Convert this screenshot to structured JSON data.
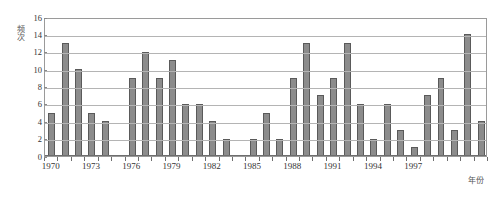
{
  "chart_data": {
    "type": "bar",
    "title": "",
    "xlabel": "年份",
    "ylabel": "频次",
    "ylim": [
      0,
      16
    ],
    "ytick_step": 2,
    "yticks": [
      0,
      2,
      4,
      6,
      8,
      10,
      12,
      14,
      16
    ],
    "xlim": [
      1970,
      2000
    ],
    "xticks": [
      1970,
      1973,
      1976,
      1979,
      1982,
      1985,
      1988,
      1991,
      1994,
      1997
    ],
    "xtick_labels": [
      "1970",
      "1973",
      "1976",
      "1979",
      "1982",
      "1985",
      "1988",
      "1991",
      "1994",
      "1997"
    ],
    "grid": true,
    "grid_axis": "y",
    "legend": false,
    "bar_color": "#8c8c8c",
    "bar_edge_color": "#5a5a5a",
    "categories": [
      "1970",
      "1971",
      "1972",
      "1973",
      "1974",
      "1975",
      "1976",
      "1977",
      "1978",
      "1979",
      "1980",
      "1981",
      "1982",
      "1983",
      "1984",
      "1985",
      "1986",
      "1987",
      "1988",
      "1989",
      "1990",
      "1991",
      "1992",
      "1993",
      "1994",
      "1995",
      "1996",
      "1997",
      "1998",
      "1999"
    ],
    "values": [
      5,
      13,
      10,
      5,
      4,
      0,
      9,
      12,
      9,
      11,
      6,
      6,
      4,
      2,
      0,
      2,
      5,
      2,
      9,
      13,
      7,
      9,
      13,
      6,
      2,
      6,
      3,
      1,
      7,
      9
    ],
    "values_full": [
      5,
      13,
      10,
      5,
      4,
      0,
      9,
      12,
      9,
      11,
      6,
      6,
      4,
      2,
      0,
      2,
      5,
      2,
      9,
      13,
      7,
      9,
      13,
      6,
      2,
      6,
      3,
      1,
      7,
      9,
      3,
      14,
      4
    ],
    "note": "values_full lists all drawn bars left-to-right including the final group"
  },
  "axes": {
    "y_title": "频次",
    "x_title": "年份"
  }
}
